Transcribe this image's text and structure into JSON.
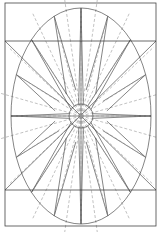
{
  "diagram": {
    "title": "",
    "type": "geometric compass-star construction in ellipse",
    "colors": {
      "background": "#ffffff",
      "line": "#333333",
      "dashed": "#999999"
    },
    "frame": {
      "x": 5,
      "y": 3,
      "width": 151,
      "height": 223
    },
    "horizontal_lines": [
      41,
      190
    ],
    "ellipse": {
      "cx": 81,
      "cy": 116,
      "rx": 70,
      "ry": 108
    },
    "inner_circle": {
      "cx": 81,
      "cy": 116,
      "r": 12
    },
    "star_points": 16
  }
}
